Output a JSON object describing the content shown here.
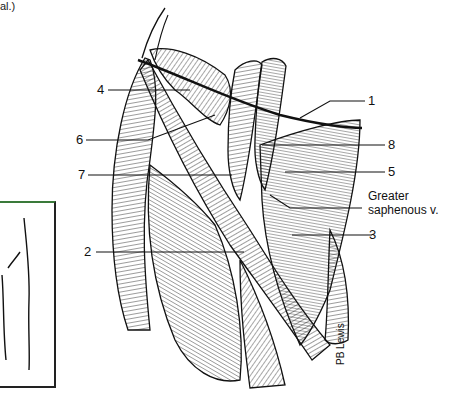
{
  "caption_fragment": "al.)",
  "labels": {
    "l1": "1",
    "l2": "2",
    "l3": "3",
    "l4": "4",
    "l5": "5",
    "l6": "6",
    "l7": "7",
    "l8": "8",
    "greater_saphenous_line1": "Greater",
    "greater_saphenous_line2": "saphenous v."
  },
  "signature": "PB Lewis",
  "colors": {
    "ink": "#1a1a1a",
    "inset_top_border": "#3a7a3a",
    "background": "#ffffff"
  }
}
